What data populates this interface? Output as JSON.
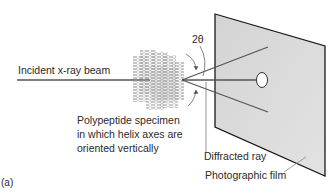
{
  "figure": {
    "panel_label": "(a)",
    "labels": {
      "incident_beam": "Incident x-ray beam",
      "angle": "2θ",
      "specimen_line1": "Polypeptide specimen",
      "specimen_line2": "in which helix axes are",
      "specimen_line3": "oriented vertically",
      "diffracted_ray": "Diffracted ray",
      "film": "Photographic film"
    },
    "colors": {
      "film_fill": "#d9d9d9",
      "film_edge": "#1a1a1a",
      "beam": "#555555",
      "specimen": "#b5b5b5",
      "text": "#2a2a2a"
    }
  }
}
